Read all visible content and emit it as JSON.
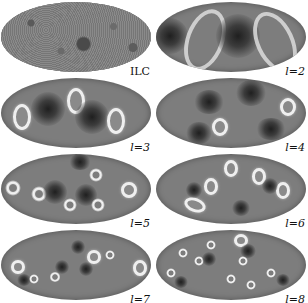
{
  "figure": {
    "panels": [
      {
        "id": "ilc",
        "label": "ILC"
      },
      {
        "id": "l2",
        "label": "l=2"
      },
      {
        "id": "l3",
        "label": "l=3"
      },
      {
        "id": "l4",
        "label": "l=4"
      },
      {
        "id": "l5",
        "label": "l=5"
      },
      {
        "id": "l6",
        "label": "l=6"
      },
      {
        "id": "l7",
        "label": "l=7"
      },
      {
        "id": "l8",
        "label": "l=8"
      }
    ]
  },
  "colors": {
    "map_base": "#7d7d7d",
    "cold_spot": "#1f1f1f",
    "hot_spot": "#f4f4f4",
    "label_text": "#111111",
    "background": "#ffffff"
  }
}
